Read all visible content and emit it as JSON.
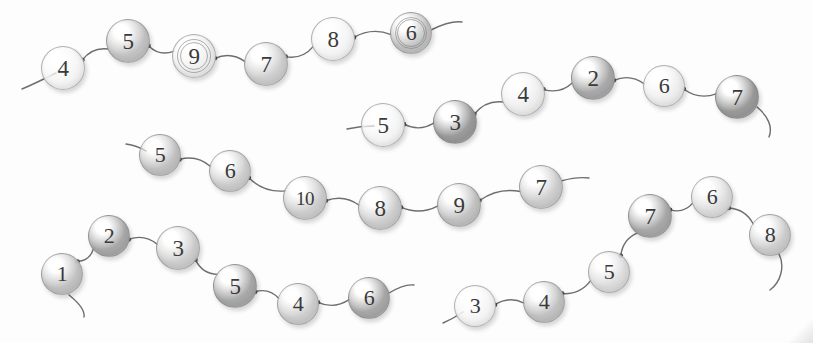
{
  "canvas": {
    "width": 813,
    "height": 343,
    "background": "#fdfdfd",
    "title": "Numbered bead chains diagram"
  },
  "palette": {
    "bead_light": "#f4f4f4",
    "bead_pale": "#ededed",
    "bead_mid_light": "#dcdcdc",
    "bead_mid": "#cdcdcd",
    "bead_medium": "#c2c2c2",
    "bead_dark": "#a8a8a8",
    "bead_darker": "#9a9a9a",
    "stroke": "#6e6e6e",
    "label_color": "#3a3a3a",
    "border": "rgba(120,120,120,0.55)"
  },
  "chains": [
    {
      "name": "chain-1",
      "beads": [
        {
          "label": "4",
          "cx": 63,
          "cy": 68,
          "r": 22,
          "shade": "bead_light",
          "ring": false
        },
        {
          "label": "5",
          "cx": 128,
          "cy": 41,
          "r": 22,
          "shade": "bead_medium",
          "ring": false
        },
        {
          "label": "9",
          "cx": 194,
          "cy": 56,
          "r": 22,
          "shade": "bead_pale",
          "ring": true
        },
        {
          "label": "7",
          "cx": 266,
          "cy": 64,
          "r": 22,
          "shade": "bead_mid",
          "ring": false
        },
        {
          "label": "8",
          "cx": 333,
          "cy": 39,
          "r": 22,
          "shade": "bead_light",
          "ring": false
        },
        {
          "label": "6",
          "cx": 411,
          "cy": 33,
          "r": 21,
          "shade": "bead_medium",
          "ring": true
        }
      ],
      "start_tail": "M 22,89 C 34,84 46,78 56,73",
      "end_tail": "M 431,30 C 443,24 454,21 462,22"
    },
    {
      "name": "chain-2",
      "beads": [
        {
          "label": "5",
          "cx": 383,
          "cy": 125,
          "r": 22,
          "shade": "bead_light",
          "ring": false
        },
        {
          "label": "3",
          "cx": 455,
          "cy": 122,
          "r": 22,
          "shade": "bead_darker",
          "ring": false
        },
        {
          "label": "4",
          "cx": 523,
          "cy": 94,
          "r": 22,
          "shade": "bead_pale",
          "ring": false
        },
        {
          "label": "2",
          "cx": 593,
          "cy": 78,
          "r": 22,
          "shade": "bead_dark",
          "ring": false
        },
        {
          "label": "6",
          "cx": 664,
          "cy": 86,
          "r": 21,
          "shade": "bead_pale",
          "ring": false
        },
        {
          "label": "7",
          "cx": 737,
          "cy": 97,
          "r": 22,
          "shade": "bead_darker",
          "ring": false
        }
      ],
      "start_tail": "M 347,129 C 356,127 365,126 374,126",
      "end_tail": "M 757,107 C 768,116 773,127 769,137"
    },
    {
      "name": "chain-3",
      "beads": [
        {
          "label": "5",
          "cx": 160,
          "cy": 155,
          "r": 21,
          "shade": "bead_medium",
          "ring": false
        },
        {
          "label": "6",
          "cx": 230,
          "cy": 171,
          "r": 21,
          "shade": "bead_mid",
          "ring": false
        },
        {
          "label": "10",
          "cx": 305,
          "cy": 198,
          "r": 22,
          "shade": "bead_mid",
          "ring": false
        },
        {
          "label": "8",
          "cx": 380,
          "cy": 208,
          "r": 22,
          "shade": "bead_mid",
          "ring": false
        },
        {
          "label": "9",
          "cx": 459,
          "cy": 205,
          "r": 22,
          "shade": "bead_medium",
          "ring": false
        },
        {
          "label": "7",
          "cx": 541,
          "cy": 187,
          "r": 22,
          "shade": "bead_mid",
          "ring": false
        }
      ],
      "start_tail": "M 126,144 C 133,145 141,148 146,151",
      "end_tail": "M 561,181 C 572,178 581,177 589,178"
    },
    {
      "name": "chain-4",
      "beads": [
        {
          "label": "1",
          "cx": 62,
          "cy": 274,
          "r": 21,
          "shade": "bead_medium",
          "ring": false
        },
        {
          "label": "2",
          "cx": 109,
          "cy": 236,
          "r": 21,
          "shade": "bead_dark",
          "ring": false
        },
        {
          "label": "3",
          "cx": 178,
          "cy": 248,
          "r": 22,
          "shade": "bead_mid",
          "ring": false
        },
        {
          "label": "5",
          "cx": 235,
          "cy": 286,
          "r": 22,
          "shade": "bead_dark",
          "ring": false
        },
        {
          "label": "4",
          "cx": 298,
          "cy": 304,
          "r": 21,
          "shade": "bead_mid",
          "ring": false
        },
        {
          "label": "6",
          "cx": 369,
          "cy": 298,
          "r": 21,
          "shade": "bead_dark",
          "ring": false
        }
      ],
      "start_tail": "M 69,295 C 79,303 85,311 84,317",
      "end_tail": "M 389,293 C 399,287 407,284 414,285"
    },
    {
      "name": "chain-5",
      "beads": [
        {
          "label": "3",
          "cx": 475,
          "cy": 306,
          "r": 21,
          "shade": "bead_light",
          "ring": false
        },
        {
          "label": "4",
          "cx": 544,
          "cy": 302,
          "r": 21,
          "shade": "bead_medium",
          "ring": false
        },
        {
          "label": "5",
          "cx": 609,
          "cy": 272,
          "r": 21,
          "shade": "bead_mid_light",
          "ring": false
        },
        {
          "label": "7",
          "cx": 650,
          "cy": 216,
          "r": 22,
          "shade": "bead_dark",
          "ring": false
        },
        {
          "label": "6",
          "cx": 712,
          "cy": 197,
          "r": 21,
          "shade": "bead_mid_light",
          "ring": false
        },
        {
          "label": "8",
          "cx": 770,
          "cy": 235,
          "r": 21,
          "shade": "bead_mid",
          "ring": false
        }
      ],
      "start_tail": "M 443,323 C 450,320 457,316 463,312",
      "end_tail": "M 779,254 C 785,266 781,282 770,290"
    }
  ]
}
